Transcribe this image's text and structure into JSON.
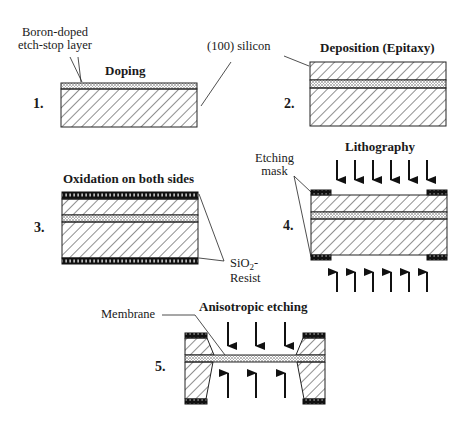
{
  "steps": [
    {
      "number": "1.",
      "title": "Doping"
    },
    {
      "number": "2.",
      "title": "Deposition (Epitaxy)"
    },
    {
      "number": "3.",
      "title": "Oxidation on both sides"
    },
    {
      "number": "4.",
      "title": "Lithography"
    },
    {
      "number": "5.",
      "title": "Anisotropic etching"
    }
  ],
  "labels": {
    "boron_line1": "Boron-doped",
    "boron_line2": "etch-stop layer",
    "silicon": "(100) silicon",
    "etching_mask_line1": "Etching",
    "etching_mask_line2": "mask",
    "sio2_prefix": "SiO",
    "sio2_sub": "2",
    "sio2_suffix": "-",
    "resist": "Resist",
    "membrane": "Membrane"
  }
}
